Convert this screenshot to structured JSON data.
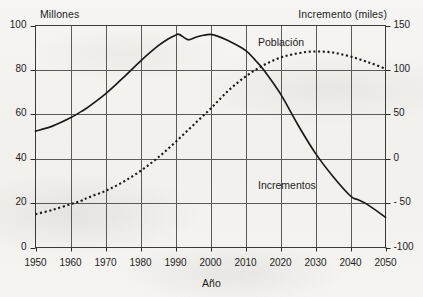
{
  "figure": {
    "axis_titles": {
      "left": "Millones",
      "right": "Incremento (miles)",
      "bottom": "Año"
    },
    "series_labels": {
      "poblacion": "Población",
      "incrementos": "Incrementos"
    }
  },
  "chart_data": {
    "type": "line",
    "title": "",
    "subtitle": "",
    "xlabel": "Año",
    "ylabel": "Millones",
    "y2label": "Incremento (miles)",
    "xlim": [
      1950,
      2050
    ],
    "ylim": [
      0,
      100
    ],
    "y2lim": [
      -100,
      150
    ],
    "grid": true,
    "legend_position": "inline-annotations",
    "xticks": [
      1950,
      1960,
      1970,
      1980,
      1990,
      2000,
      2010,
      2020,
      2030,
      2040,
      2050
    ],
    "xtick_labels": [
      "1950",
      "1960",
      "1970",
      "1980",
      "1990",
      "2000",
      "2010",
      "2020",
      "2030",
      "2040",
      "2050"
    ],
    "yticks": [
      0,
      20,
      40,
      60,
      80,
      100
    ],
    "ytick_labels": [
      "0",
      "20",
      "40",
      "60",
      "80",
      "100"
    ],
    "y2ticks": [
      -100,
      -50,
      0,
      50,
      100,
      150
    ],
    "y2tick_labels": [
      "-100",
      "- 50",
      "0",
      "50",
      "100",
      "150"
    ],
    "series": [
      {
        "name": "Población",
        "axis": "left",
        "style": "dotted",
        "color": "#1a1a1a",
        "x": [
          1950,
          1955,
          1960,
          1963,
          1965,
          1970,
          1975,
          1980,
          1985,
          1990,
          1995,
          2000,
          2005,
          2010,
          2015,
          2020,
          2025,
          2030,
          2035,
          2040,
          2045,
          2050
        ],
        "values": [
          15.0,
          17.0,
          19.5,
          21.0,
          22.5,
          25.5,
          29.5,
          34.5,
          40.5,
          47.5,
          55.0,
          62.5,
          70.5,
          77.0,
          82.0,
          85.5,
          87.5,
          88.3,
          87.8,
          86.0,
          83.5,
          80.5
        ]
      },
      {
        "name": "Incrementos",
        "axis": "right",
        "style": "solid",
        "color": "#1a1a1a",
        "x": [
          1950,
          1955,
          1960,
          1963,
          1965,
          1970,
          1975,
          1980,
          1985,
          1988,
          1990,
          1991,
          1993,
          1994,
          1996,
          1998,
          2000,
          2002,
          2005,
          2010,
          2013,
          2015,
          2020,
          2025,
          2030,
          2035,
          2040,
          2042,
          2045,
          2050
        ],
        "values": [
          31.0,
          37.0,
          46.0,
          53.0,
          58.0,
          73.0,
          91.0,
          110.0,
          127.0,
          135.0,
          139.0,
          140.0,
          135.0,
          134.0,
          137.0,
          139.0,
          140.0,
          138.0,
          133.0,
          122.0,
          110.0,
          101.0,
          73.0,
          38.0,
          6.0,
          -20.0,
          -42.0,
          -46.0,
          -52.0,
          -66.0
        ]
      }
    ],
    "annotations": [
      {
        "text": "Población",
        "x": 2022,
        "y2": 128
      },
      {
        "text": "Incrementos",
        "x": 2022,
        "y2": -17
      }
    ]
  }
}
